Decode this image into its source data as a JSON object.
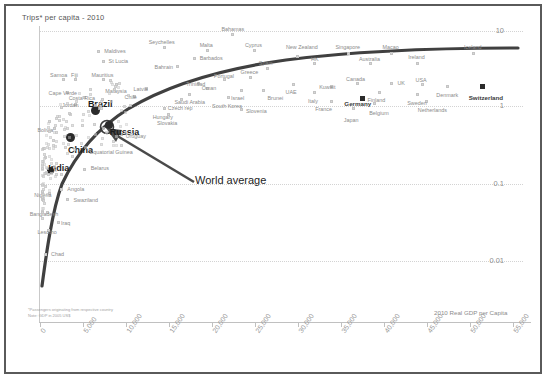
{
  "chart": {
    "title": "Trips* per capita - 2010",
    "xlabel": "2010 Real GDP per Capita",
    "note_line1": "*Passengers originating from respective country",
    "note_line2": "Note: GDP in 2005 US$",
    "annotation": "World average"
  },
  "chart_data": {
    "type": "scatter",
    "title": "Trips* per capita - 2010",
    "xlabel": "2010 Real GDP per Capita",
    "ylabel": "Trips per capita",
    "yscale": "log",
    "grid": true,
    "legend": "none",
    "xlim": [
      0,
      57000
    ],
    "ylim": [
      0.004,
      30
    ],
    "xticks": [
      "0",
      "5,000",
      "10,000",
      "15,000",
      "20,000",
      "25,000",
      "30,000",
      "35,000",
      "40,000",
      "45,000",
      "50,000",
      "55,000"
    ],
    "xtick_values": [
      0,
      5000,
      10000,
      15000,
      20000,
      25000,
      30000,
      35000,
      40000,
      45000,
      50000,
      55000
    ],
    "yticks": [
      "10",
      "1",
      "0.1",
      "0.01"
    ],
    "ytick_values": [
      10,
      1,
      0.1,
      0.01
    ],
    "annotations": [
      {
        "text": "World average",
        "note": "arrow points to logarithmic world-average trend curve near Russia"
      }
    ],
    "trendline": {
      "name": "World average",
      "shape": "logarithmic",
      "color": "#404040"
    },
    "points": [
      {
        "label": "Bahamas",
        "x": 22500,
        "y": 9.0,
        "emphasis": "none"
      },
      {
        "label": "Seychelles",
        "x": 14500,
        "y": 6.0,
        "emphasis": "none"
      },
      {
        "label": "Malta",
        "x": 19500,
        "y": 5.6,
        "emphasis": "none"
      },
      {
        "label": "Cyprus",
        "x": 25000,
        "y": 5.6,
        "emphasis": "none"
      },
      {
        "label": "Maldives",
        "x": 6900,
        "y": 5.3,
        "emphasis": "none"
      },
      {
        "label": "Barbados",
        "x": 18000,
        "y": 4.3,
        "emphasis": "none"
      },
      {
        "label": "St Lucia",
        "x": 7400,
        "y": 4.0,
        "emphasis": "none"
      },
      {
        "label": "Bahrain",
        "x": 16000,
        "y": 3.4,
        "emphasis": "none"
      },
      {
        "label": "New Zealand",
        "x": 30000,
        "y": 4.6,
        "emphasis": "none"
      },
      {
        "label": "Singapore",
        "x": 36000,
        "y": 5.0,
        "emphasis": "none"
      },
      {
        "label": "Macao",
        "x": 41000,
        "y": 5.0,
        "emphasis": "none"
      },
      {
        "label": "Iceland",
        "x": 50500,
        "y": 5.0,
        "emphasis": "none"
      },
      {
        "label": "Australia",
        "x": 38500,
        "y": 3.7,
        "emphasis": "none"
      },
      {
        "label": "Ireland",
        "x": 44000,
        "y": 3.7,
        "emphasis": "none"
      },
      {
        "label": "HK",
        "x": 32000,
        "y": 3.7,
        "emphasis": "none"
      },
      {
        "label": "Spain",
        "x": 26500,
        "y": 3.2,
        "emphasis": "none"
      },
      {
        "label": "Greece",
        "x": 24500,
        "y": 2.5,
        "emphasis": "none"
      },
      {
        "label": "Portugal",
        "x": 21500,
        "y": 2.3,
        "emphasis": "none"
      },
      {
        "label": "Trinidad",
        "x": 18500,
        "y": 2.1,
        "emphasis": "none"
      },
      {
        "label": "Canada",
        "x": 37000,
        "y": 2.1,
        "emphasis": "none"
      },
      {
        "label": "UK",
        "x": 41000,
        "y": 2.1,
        "emphasis": "none"
      },
      {
        "label": "USA",
        "x": 44500,
        "y": 2.0,
        "emphasis": "none"
      },
      {
        "label": "UAE",
        "x": 29500,
        "y": 2.0,
        "emphasis": "none"
      },
      {
        "label": "Kuwait",
        "x": 34000,
        "y": 1.9,
        "emphasis": "none"
      },
      {
        "label": "Denmark",
        "x": 47500,
        "y": 1.9,
        "emphasis": "none"
      },
      {
        "label": "Switzerland",
        "x": 51500,
        "y": 1.9,
        "emphasis": "highlight-square"
      },
      {
        "label": "Italy",
        "x": 32000,
        "y": 1.6,
        "emphasis": "none"
      },
      {
        "label": "Finland",
        "x": 39500,
        "y": 1.6,
        "emphasis": "none"
      },
      {
        "label": "Sweden",
        "x": 44000,
        "y": 1.5,
        "emphasis": "none"
      },
      {
        "label": "Germany",
        "x": 37500,
        "y": 1.35,
        "emphasis": "highlight-square"
      },
      {
        "label": "France",
        "x": 34000,
        "y": 1.2,
        "emphasis": "none"
      },
      {
        "label": "Belgium",
        "x": 39000,
        "y": 1.15,
        "emphasis": "none"
      },
      {
        "label": "Netherlands",
        "x": 45000,
        "y": 1.2,
        "emphasis": "none"
      },
      {
        "label": "Japan",
        "x": 36500,
        "y": 1.0,
        "emphasis": "none"
      },
      {
        "label": "Israel",
        "x": 23500,
        "y": 1.7,
        "emphasis": "none"
      },
      {
        "label": "Brunei",
        "x": 26000,
        "y": 1.7,
        "emphasis": "none"
      },
      {
        "label": "Oman",
        "x": 19500,
        "y": 1.8,
        "emphasis": "none"
      },
      {
        "label": "Saudi Arabia",
        "x": 17500,
        "y": 1.5,
        "emphasis": "none"
      },
      {
        "label": "South Korea",
        "x": 22000,
        "y": 1.35,
        "emphasis": "none"
      },
      {
        "label": "Czech rep",
        "x": 16500,
        "y": 1.3,
        "emphasis": "none"
      },
      {
        "label": "Slovenia",
        "x": 23500,
        "y": 0.95,
        "emphasis": "none"
      },
      {
        "label": "Hungary",
        "x": 14500,
        "y": 1.0,
        "emphasis": "none"
      },
      {
        "label": "Slovakia",
        "x": 15000,
        "y": 0.82,
        "emphasis": "none"
      },
      {
        "label": "Latvia",
        "x": 12500,
        "y": 1.8,
        "emphasis": "none"
      },
      {
        "label": "Chile",
        "x": 11000,
        "y": 1.4,
        "emphasis": "none"
      },
      {
        "label": "Mauritius",
        "x": 7500,
        "y": 2.3,
        "emphasis": "none"
      },
      {
        "label": "Malaysia",
        "x": 9000,
        "y": 2.0,
        "emphasis": "none"
      },
      {
        "label": "Samoa",
        "x": 2800,
        "y": 2.3,
        "emphasis": "none"
      },
      {
        "label": "Fiji",
        "x": 4200,
        "y": 2.3,
        "emphasis": "none"
      },
      {
        "label": "Cape Verde",
        "x": 3200,
        "y": 1.6,
        "emphasis": "none"
      },
      {
        "label": "Costa Rica",
        "x": 5200,
        "y": 1.35,
        "emphasis": "none"
      },
      {
        "label": "Jordan",
        "x": 4200,
        "y": 1.1,
        "emphasis": "none"
      },
      {
        "label": "Brazil",
        "x": 6500,
        "y": 0.95,
        "emphasis": "bric"
      },
      {
        "label": "Russia",
        "x": 8000,
        "y": 0.62,
        "emphasis": "bric"
      },
      {
        "label": "China",
        "x": 3500,
        "y": 0.42,
        "emphasis": "bric"
      },
      {
        "label": "India",
        "x": 1200,
        "y": 0.16,
        "emphasis": "bric"
      },
      {
        "label": "Bolivia",
        "x": 1800,
        "y": 0.55,
        "emphasis": "none"
      },
      {
        "label": "Uruguay",
        "x": 9500,
        "y": 0.45,
        "emphasis": "none"
      },
      {
        "label": "Equatorial Guinea",
        "x": 6000,
        "y": 0.28,
        "emphasis": "none"
      },
      {
        "label": "Belarus",
        "x": 5200,
        "y": 0.16,
        "emphasis": "none"
      },
      {
        "label": "Angola",
        "x": 2600,
        "y": 0.09,
        "emphasis": "none"
      },
      {
        "label": "Nigeria",
        "x": 1200,
        "y": 0.08,
        "emphasis": "none"
      },
      {
        "label": "Swaziland",
        "x": 3200,
        "y": 0.065,
        "emphasis": "none"
      },
      {
        "label": "Bangladesh",
        "x": 900,
        "y": 0.045,
        "emphasis": "none"
      },
      {
        "label": "Iraq",
        "x": 2200,
        "y": 0.033,
        "emphasis": "none"
      },
      {
        "label": "Lesotho",
        "x": 1100,
        "y": 0.026,
        "emphasis": "none"
      },
      {
        "label": "Chad",
        "x": 700,
        "y": 0.013,
        "emphasis": "none"
      }
    ]
  }
}
